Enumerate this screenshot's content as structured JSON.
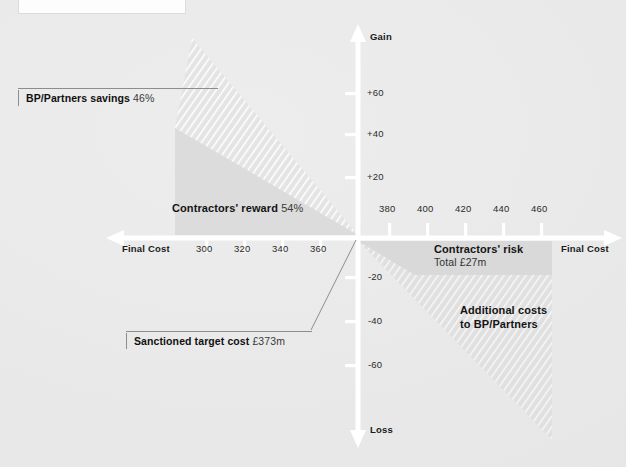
{
  "figure": {
    "title_box_text": "Gainshare / painshare principle",
    "background_color": "#e9e9e9",
    "axis_color": "#ffffff"
  },
  "axes": {
    "y_top_label": "Gain",
    "y_bottom_label": "Loss",
    "x_left_label": "Final Cost",
    "x_right_label": "Final Cost",
    "y_ticks_positive": [
      "+20",
      "+40",
      "+60"
    ],
    "y_ticks_negative": [
      "-20",
      "-40",
      "-60"
    ],
    "x_ticks_left": [
      "300",
      "320",
      "340",
      "360"
    ],
    "x_ticks_right": [
      "380",
      "400",
      "420",
      "440",
      "460"
    ]
  },
  "regions": {
    "savings": {
      "label": "BP/Partners savings",
      "value": "46%",
      "fill": "hatched"
    },
    "reward": {
      "label": "Contractors' reward",
      "value": "54%",
      "fill": "solid-gray"
    },
    "risk": {
      "label": "Contractors' risk",
      "sub": "Total £27m",
      "fill": "solid-gray"
    },
    "additional": {
      "line1": "Additional costs",
      "line2": "to BP/Partners",
      "fill": "hatched"
    }
  },
  "callouts": {
    "target_cost": {
      "label": "Sanctioned target cost",
      "value": "£373m"
    }
  }
}
